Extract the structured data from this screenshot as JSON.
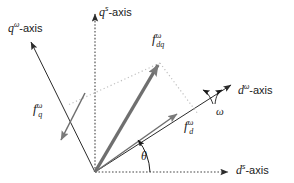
{
  "figure": {
    "background_color": "#ffffff",
    "axes": [
      {
        "id": "q-omega-axis",
        "var": "q",
        "superscript": "ω",
        "suffix": "-axis",
        "style": "solid",
        "color": "#2b2b2b",
        "label": "qω-axis"
      },
      {
        "id": "q-s-axis",
        "var": "q",
        "superscript": "s",
        "suffix": "-axis",
        "style": "dotted",
        "color": "#2b2b2b",
        "label": "qs-axis"
      },
      {
        "id": "d-omega-axis",
        "var": "d",
        "superscript": "ω",
        "suffix": "-axis",
        "style": "solid",
        "color": "#2b2b2b",
        "label": "dω-axis"
      },
      {
        "id": "d-s-axis",
        "var": "d",
        "superscript": "s",
        "suffix": "-axis",
        "style": "dotted",
        "color": "#2b2b2b",
        "label": "ds-axis"
      }
    ],
    "vectors": [
      {
        "id": "f-dq-omega",
        "var": "f",
        "subscript": "dq",
        "superscript": "ω",
        "color": "#6b6b6b",
        "weight": "thick",
        "label": "f_dqω"
      },
      {
        "id": "f-d-omega",
        "var": "f",
        "subscript": "d",
        "superscript": "ω",
        "color": "#6b6b6b",
        "weight": "thin",
        "label": "f_dω"
      },
      {
        "id": "f-q-omega",
        "var": "f",
        "subscript": "q",
        "superscript": "ω",
        "color": "#6b6b6b",
        "weight": "thin",
        "label": "f_qω"
      }
    ],
    "annotations": [
      {
        "id": "theta-angle",
        "symbol": "θ",
        "meaning": "angle between d-s-axis and d-omega-axis"
      },
      {
        "id": "omega-rotation",
        "symbol": "ω",
        "meaning": "angular speed of rotating frame"
      }
    ],
    "projection_lines": {
      "style": "dotted",
      "color": "#b9b9b9"
    }
  }
}
